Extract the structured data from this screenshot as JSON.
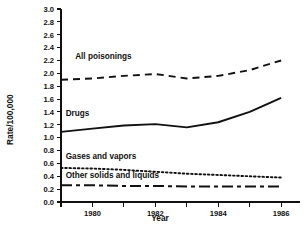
{
  "chart_data": {
    "type": "line",
    "title": "",
    "xlabel": "Year",
    "ylabel": "Rate/100,000",
    "x": [
      1979,
      1980,
      1981,
      1982,
      1983,
      1984,
      1985,
      1986
    ],
    "xlim": [
      1979,
      1986.6
    ],
    "ylim": [
      0.0,
      3.0
    ],
    "grid": false,
    "legend_position": "inline-annotations",
    "xticks": [
      1979,
      1980,
      1981,
      1982,
      1983,
      1984,
      1985,
      1986
    ],
    "xtick_labels": [
      "",
      "1980",
      "",
      "1982",
      "",
      "1984",
      "",
      "1986"
    ],
    "yticks": [
      0.0,
      0.2,
      0.4,
      0.6,
      0.8,
      1.0,
      1.2,
      1.4,
      1.6,
      1.8,
      2.0,
      2.2,
      2.4,
      2.6,
      2.8,
      3.0
    ],
    "ytick_labels": [
      "0.0",
      "0.2",
      "0.4",
      "0.6",
      "0.8",
      "1.0",
      "1.2",
      "1.4",
      "1.6",
      "1.8",
      "2.0",
      "2.2",
      "2.4",
      "2.6",
      "2.8",
      "3.0"
    ],
    "series": [
      {
        "name": "All poisonings",
        "style": "dashed",
        "color": "#111111",
        "values": [
          1.9,
          1.92,
          1.96,
          1.99,
          1.92,
          1.96,
          2.05,
          2.2
        ]
      },
      {
        "name": "Drugs",
        "style": "solid",
        "color": "#111111",
        "values": [
          1.09,
          1.14,
          1.19,
          1.21,
          1.16,
          1.24,
          1.4,
          1.62
        ]
      },
      {
        "name": "Gases and vapors",
        "style": "dotted",
        "color": "#111111",
        "values": [
          0.53,
          0.52,
          0.5,
          0.47,
          0.44,
          0.42,
          0.4,
          0.38
        ]
      },
      {
        "name": "Other solids and liquids",
        "style": "dashdot",
        "color": "#111111",
        "values": [
          0.26,
          0.26,
          0.25,
          0.25,
          0.24,
          0.24,
          0.24,
          0.24
        ]
      }
    ],
    "annotations": [
      {
        "text": "All poisonings",
        "x": 1979.45,
        "y": 2.22
      },
      {
        "text": "Drugs",
        "x": 1979.15,
        "y": 1.34
      },
      {
        "text": "Gases and vapors",
        "x": 1979.15,
        "y": 0.67
      },
      {
        "text": "Other solids and liquids",
        "x": 1979.15,
        "y": 0.37
      }
    ]
  },
  "figure": {
    "background_color": "#ffffff",
    "ink_color": "#111111"
  }
}
